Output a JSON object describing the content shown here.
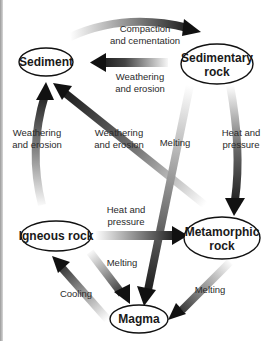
{
  "diagram": {
    "colors": {
      "arrow_dark": "#111111",
      "arrow_light": "#e6e6e6",
      "node_stroke": "#111111",
      "border": "#9a9a9a"
    },
    "nodes": {
      "sediment": {
        "label": "Sediment"
      },
      "sedimentary": {
        "line1": "Sedimentary",
        "line2": "rock"
      },
      "igneous": {
        "label": "Igneous rock"
      },
      "metamorphic": {
        "line1": "Metamorphic",
        "line2": "rock"
      },
      "magma": {
        "label": "Magma"
      }
    },
    "edges": {
      "compaction": {
        "line1": "Compaction",
        "line2": "and cementation",
        "from": "Sediment",
        "to": "Sedimentary rock"
      },
      "sed_weathering": {
        "line1": "Weathering",
        "line2": "and erosion",
        "from": "Sedimentary rock",
        "to": "Sediment"
      },
      "ign_weathering": {
        "line1": "Weathering",
        "line2": "and erosion",
        "from": "Igneous rock",
        "to": "Sediment"
      },
      "meta_weathering": {
        "line1": "Weathering",
        "line2": "and erosion",
        "from": "Metamorphic rock",
        "to": "Sediment"
      },
      "sed_melting": {
        "label": "Melting",
        "from": "Sedimentary rock",
        "to": "Magma"
      },
      "sed_heat": {
        "line1": "Heat and",
        "line2": "pressure",
        "from": "Sedimentary rock",
        "to": "Metamorphic rock"
      },
      "ign_heat": {
        "line1": "Heat and",
        "line2": "pressure",
        "from": "Igneous rock",
        "to": "Metamorphic rock"
      },
      "ign_melting": {
        "label": "Melting",
        "from": "Igneous rock",
        "to": "Magma"
      },
      "cooling": {
        "label": "Cooling",
        "from": "Magma",
        "to": "Igneous rock"
      },
      "meta_melting": {
        "label": "Melting",
        "from": "Metamorphic rock",
        "to": "Magma"
      }
    }
  }
}
